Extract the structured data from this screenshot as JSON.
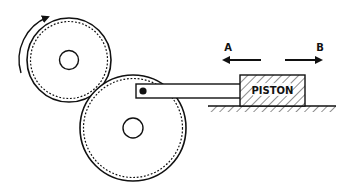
{
  "diagram": {
    "type": "mechanism",
    "labels": {
      "piston": "PISTON",
      "direction_a": "A",
      "direction_b": "B"
    },
    "components": [
      {
        "id": "small-gear",
        "description": "upper-left gear with rotation arrow"
      },
      {
        "id": "large-gear",
        "description": "lower gear meshing with small gear, connected to rod"
      },
      {
        "id": "connecting-rod",
        "description": "rod from large gear pin to piston"
      },
      {
        "id": "piston",
        "description": "hatched block sliding on ground"
      },
      {
        "id": "ground",
        "description": "hatched base surface"
      }
    ],
    "arrows": [
      {
        "id": "rotation-arrow",
        "direction": "clockwise"
      },
      {
        "id": "arrow-a",
        "direction": "left"
      },
      {
        "id": "arrow-b",
        "direction": "right"
      }
    ],
    "colors": {
      "stroke": "#111111",
      "background": "#ffffff"
    }
  }
}
